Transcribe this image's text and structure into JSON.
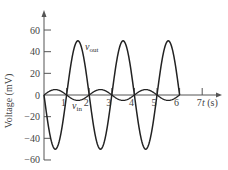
{
  "chart_data": {
    "type": "line",
    "title": "",
    "xlabel": "t (s)",
    "ylabel": "Voltage (mV)",
    "xlim": [
      0,
      7.8
    ],
    "ylim": [
      -60,
      60
    ],
    "grid": false,
    "x_ticks": [
      1,
      2,
      3,
      4,
      5,
      6,
      7
    ],
    "x_tick_labels": [
      "1",
      "2",
      "3",
      "4",
      "5",
      "6",
      "7"
    ],
    "y_ticks": [
      60,
      40,
      20,
      0,
      -20,
      -40,
      -60
    ],
    "y_tick_labels": [
      "60",
      "40",
      "20",
      "0",
      "−20",
      "−40",
      "−60"
    ],
    "series": [
      {
        "name": "v_out",
        "label_main": "v",
        "label_sub": "out",
        "formula": "-50*sin(pi*t)",
        "amplitude_mV": 50,
        "period_s": 2,
        "t_range": [
          0,
          6
        ],
        "x": [
          0,
          0.5,
          1,
          1.5,
          2,
          2.5,
          3,
          3.5,
          4,
          4.5,
          5,
          5.5,
          6
        ],
        "values": [
          0,
          -50,
          0,
          50,
          0,
          -50,
          0,
          50,
          0,
          -50,
          0,
          50,
          0
        ]
      },
      {
        "name": "v_in",
        "label_main": "v",
        "label_sub": "in",
        "formula": "5*sin(pi*t)",
        "amplitude_mV": 5,
        "period_s": 2,
        "t_range": [
          0,
          6
        ],
        "x": [
          0,
          0.5,
          1,
          1.5,
          2,
          2.5,
          3,
          3.5,
          4,
          4.5,
          5,
          5.5,
          6
        ],
        "values": [
          0,
          5,
          0,
          -5,
          0,
          5,
          0,
          -5,
          0,
          5,
          0,
          -5,
          0
        ]
      }
    ],
    "legend": "inline labels near curves"
  },
  "colors": {
    "axis": "#555555",
    "curve": "#222222"
  },
  "layout": {
    "x0": 44,
    "y0": 95,
    "px_per_s": 22.6,
    "px_per_mV": 1.083,
    "y_axis_top": 10,
    "y_axis_bottom": 160,
    "x_axis_end": 222
  }
}
